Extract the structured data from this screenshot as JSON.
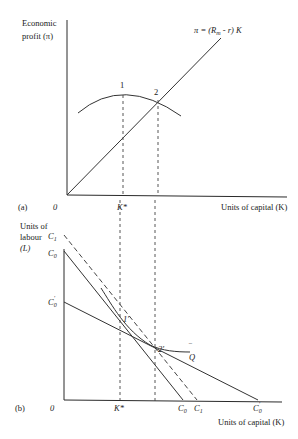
{
  "panel_a": {
    "label": "(a)",
    "origin_label": "0",
    "y_axis_label_line1": "Economic",
    "y_axis_label_line2": "profit (π)",
    "x_axis_label": "Units of capital (K)",
    "kstar_label": "K*",
    "point1_label": "1",
    "point2_label": "2",
    "line_label": "π = (R",
    "line_label_sub": "m",
    "line_label_end": " - r) K"
  },
  "panel_b": {
    "label": "(b)",
    "origin_label": "0",
    "y_axis_label_line1": "Units of",
    "y_axis_label_line2": "labour",
    "y_axis_label_line3": "(L)",
    "x_axis_label": "Units of capital (K)",
    "kstar_label": "K*",
    "c1_label": "C",
    "c1_sub": "1",
    "c0_label": "C",
    "c0_sub": "0",
    "c0p_label": "C",
    "c0p_sub": "0",
    "c0p_prime": "'",
    "point1_label": "1'",
    "point2_label": "2'",
    "isoquant_label": "Q",
    "isoquant_bar": "‾",
    "xc0_label": "C",
    "xc0_sub": "0",
    "xc1_label": "C",
    "xc1_sub": "1",
    "xc0p_label": "C",
    "xc0p_sub": "0",
    "xc0p_prime": "'"
  }
}
